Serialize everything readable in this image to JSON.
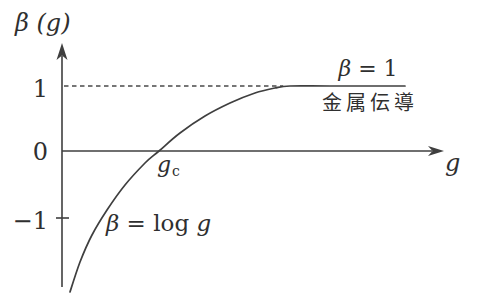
{
  "figure": {
    "background": "#ffffff",
    "line_color": "#3f3f3f",
    "text_color": "#2f2f2f"
  },
  "labels": {
    "y_axis_title": "β (g)",
    "x_axis_title": "g",
    "tick_plus1": "1",
    "tick_zero": "0",
    "tick_minus1": "−1",
    "critical_point": {
      "main": "g",
      "sub": "c"
    },
    "asymptote_beta": "β",
    "asymptote_rest": " = 1",
    "asymptote_caption": "金属伝導",
    "log_curve_beta_eq": "β = ",
    "log_curve_log_word": "log ",
    "log_curve_g_var": "g"
  },
  "chart_data": {
    "type": "line",
    "xlabel": "g",
    "ylabel": "β (g)",
    "x_axis": {
      "unit": "g in units of g_c (g_c = 1)",
      "range": [
        0,
        3.9
      ],
      "tick_labels": [
        "g_c"
      ],
      "tick_values": [
        1
      ]
    },
    "y_axis": {
      "range": [
        -2.4,
        1.6
      ],
      "tick_values": [
        1,
        0,
        -1
      ],
      "tick_labels": [
        "1",
        "0",
        "−1"
      ]
    },
    "grid": false,
    "series": [
      {
        "name": "β(g) = log g, saturating at β = 1",
        "points": [
          [
            0.082,
            -2.169
          ],
          [
            0.186,
            -1.708
          ],
          [
            0.309,
            -1.292
          ],
          [
            0.464,
            -0.908
          ],
          [
            0.649,
            -0.523
          ],
          [
            0.856,
            -0.185
          ],
          [
            1.0,
            0.0
          ],
          [
            1.216,
            0.277
          ],
          [
            1.474,
            0.538
          ],
          [
            1.732,
            0.738
          ],
          [
            1.99,
            0.892
          ],
          [
            2.196,
            0.969
          ],
          [
            2.351,
            1.0
          ],
          [
            2.763,
            1.0
          ],
          [
            3.536,
            1.0
          ]
        ]
      }
    ],
    "dashed_line": {
      "beta": 1.0,
      "g_start": 0.021,
      "g_end": 2.28,
      "label": "β = 1"
    },
    "annotations": [
      {
        "text": "β = 1",
        "anchor_g": 3.16,
        "anchor_beta": 1.25
      },
      {
        "text": "金属伝導",
        "anchor_g": 3.2,
        "anchor_beta": 0.72,
        "meaning": "metallic conduction"
      },
      {
        "text": "β = log g",
        "anchor_g": 0.97,
        "anchor_beta": -1.12
      },
      {
        "text": "g_c",
        "anchor_g": 1.07,
        "anchor_beta": -0.18
      }
    ]
  }
}
